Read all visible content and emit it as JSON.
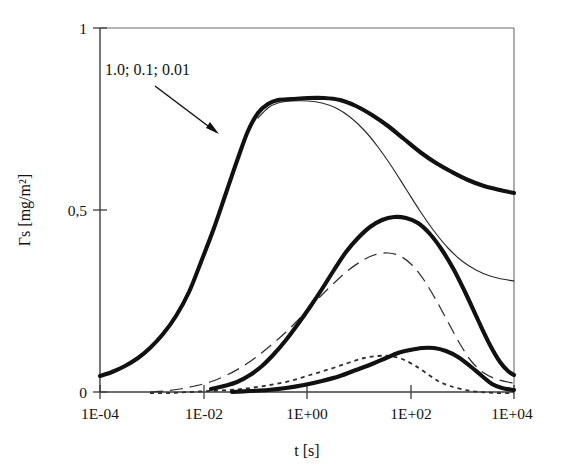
{
  "figure": {
    "background": "#ffffff",
    "ink_color": "#111111"
  },
  "chart_data": {
    "type": "line",
    "title": "",
    "xlabel": "t [s]",
    "ylabel": "Γs [mg/m²]",
    "x_scale": "log",
    "xlim": [
      0.0001,
      10000
    ],
    "ylim": [
      0,
      1
    ],
    "grid": false,
    "legend_position": "none",
    "x_tick_labels": [
      "1E-04",
      "1E-02",
      "1E+00",
      "1E+02",
      "1E+04"
    ],
    "x_tick_values": [
      0.0001,
      0.01,
      1,
      100,
      10000
    ],
    "y_tick_labels": [
      "0",
      "0,5",
      "1"
    ],
    "y_tick_values": [
      0,
      0.5,
      1
    ],
    "annotations": [
      {
        "text": "1.0; 0.1; 0.01",
        "x_px": 105,
        "y_px": 75,
        "arrow_from_px": [
          155,
          86
        ],
        "arrow_to_px": [
          219,
          134
        ],
        "note": "labels the family of three curves"
      }
    ],
    "series": [
      {
        "name": "c = 1.0 (thick solid, upper)",
        "style": "thick-solid",
        "label": "1.0",
        "points_px": [
          [
            100,
            376
          ],
          [
            112,
            372
          ],
          [
            125,
            366
          ],
          [
            138,
            358
          ],
          [
            150,
            348
          ],
          [
            163,
            334
          ],
          [
            176,
            316
          ],
          [
            189,
            292
          ],
          [
            201,
            262
          ],
          [
            214,
            228
          ],
          [
            226,
            193
          ],
          [
            238,
            158
          ],
          [
            248,
            131
          ],
          [
            258,
            113
          ],
          [
            268,
            104
          ],
          [
            278,
            100
          ],
          [
            292,
            99
          ],
          [
            308,
            98
          ],
          [
            324,
            98
          ],
          [
            340,
            100
          ],
          [
            356,
            106
          ],
          [
            372,
            115
          ],
          [
            388,
            126
          ],
          [
            404,
            139
          ],
          [
            420,
            152
          ],
          [
            436,
            163
          ],
          [
            452,
            172
          ],
          [
            468,
            180
          ],
          [
            484,
            186
          ],
          [
            500,
            190
          ],
          [
            514,
            193
          ]
        ]
      },
      {
        "name": "c = 1.0 (thin solid, upper)",
        "style": "thin-solid",
        "label": "1.0",
        "points_px": [
          [
            258,
            118
          ],
          [
            268,
            108
          ],
          [
            278,
            103
          ],
          [
            292,
            101
          ],
          [
            308,
            101
          ],
          [
            322,
            103
          ],
          [
            336,
            108
          ],
          [
            350,
            117
          ],
          [
            364,
            130
          ],
          [
            378,
            147
          ],
          [
            392,
            167
          ],
          [
            406,
            189
          ],
          [
            420,
            211
          ],
          [
            434,
            231
          ],
          [
            448,
            248
          ],
          [
            462,
            261
          ],
          [
            476,
            270
          ],
          [
            490,
            276
          ],
          [
            502,
            279
          ],
          [
            514,
            281
          ]
        ]
      },
      {
        "name": "c = 0.1 (thick solid, middle)",
        "style": "thick-solid",
        "label": "0.1",
        "points_px": [
          [
            211,
            389
          ],
          [
            224,
            386
          ],
          [
            237,
            382
          ],
          [
            250,
            375
          ],
          [
            262,
            366
          ],
          [
            274,
            354
          ],
          [
            286,
            340
          ],
          [
            298,
            324
          ],
          [
            310,
            307
          ],
          [
            322,
            289
          ],
          [
            334,
            270
          ],
          [
            346,
            252
          ],
          [
            358,
            238
          ],
          [
            370,
            227
          ],
          [
            382,
            220
          ],
          [
            394,
            217
          ],
          [
            406,
            218
          ],
          [
            418,
            223
          ],
          [
            430,
            234
          ],
          [
            442,
            250
          ],
          [
            454,
            270
          ],
          [
            466,
            294
          ],
          [
            478,
            320
          ],
          [
            490,
            345
          ],
          [
            500,
            362
          ],
          [
            508,
            371
          ],
          [
            514,
            375
          ]
        ]
      },
      {
        "name": "c = 0.1 (long-dashed, middle)",
        "style": "dashed",
        "label": "0.1",
        "points_px": [
          [
            150,
            392
          ],
          [
            165,
            391
          ],
          [
            180,
            389
          ],
          [
            195,
            386
          ],
          [
            210,
            382
          ],
          [
            225,
            376
          ],
          [
            240,
            368
          ],
          [
            255,
            358
          ],
          [
            270,
            346
          ],
          [
            285,
            333
          ],
          [
            300,
            318
          ],
          [
            315,
            302
          ],
          [
            330,
            287
          ],
          [
            345,
            273
          ],
          [
            360,
            262
          ],
          [
            374,
            255
          ],
          [
            388,
            253
          ],
          [
            400,
            256
          ],
          [
            412,
            265
          ],
          [
            424,
            280
          ],
          [
            436,
            300
          ],
          [
            448,
            322
          ],
          [
            460,
            344
          ],
          [
            472,
            362
          ],
          [
            484,
            373
          ],
          [
            496,
            379
          ],
          [
            508,
            382
          ],
          [
            514,
            383
          ]
        ]
      },
      {
        "name": "c = 0.01 (thick solid, lower)",
        "style": "thick-solid",
        "label": "0.01",
        "points_px": [
          [
            232,
            392
          ],
          [
            250,
            391
          ],
          [
            268,
            390
          ],
          [
            286,
            388
          ],
          [
            304,
            385
          ],
          [
            322,
            381
          ],
          [
            340,
            376
          ],
          [
            356,
            370
          ],
          [
            372,
            364
          ],
          [
            386,
            358
          ],
          [
            398,
            353
          ],
          [
            410,
            350
          ],
          [
            422,
            348
          ],
          [
            434,
            348
          ],
          [
            446,
            351
          ],
          [
            458,
            357
          ],
          [
            470,
            366
          ],
          [
            482,
            376
          ],
          [
            492,
            384
          ],
          [
            502,
            388
          ],
          [
            514,
            390
          ]
        ]
      },
      {
        "name": "c = 0.01 (short-dotted, lower)",
        "style": "dotted",
        "label": "0.01",
        "points_px": [
          [
            150,
            393
          ],
          [
            170,
            393
          ],
          [
            190,
            392
          ],
          [
            210,
            391
          ],
          [
            230,
            390
          ],
          [
            250,
            388
          ],
          [
            270,
            385
          ],
          [
            290,
            381
          ],
          [
            310,
            375
          ],
          [
            330,
            369
          ],
          [
            348,
            363
          ],
          [
            364,
            358
          ],
          [
            378,
            356
          ],
          [
            390,
            356
          ],
          [
            402,
            359
          ],
          [
            414,
            365
          ],
          [
            426,
            373
          ],
          [
            438,
            381
          ],
          [
            450,
            386
          ],
          [
            465,
            390
          ],
          [
            480,
            392
          ],
          [
            496,
            393
          ],
          [
            514,
            393
          ]
        ]
      }
    ],
    "readings": {
      "upper_curve_start_value": 0.04,
      "upper_curve_plateau_value": 0.8,
      "upper_curve_end_value": 0.6,
      "upper_thin_end_value": 0.37,
      "middle_curve_peak_value": 0.48,
      "middle_dashed_peak_value": 0.4,
      "middle_curve_end_value": 0.09,
      "middle_dashed_end_value": 0.06,
      "lower_curve_peak_value": 0.11,
      "lower_dotted_peak_value": 0.09,
      "lower_curve_end_value": 0.02
    }
  }
}
